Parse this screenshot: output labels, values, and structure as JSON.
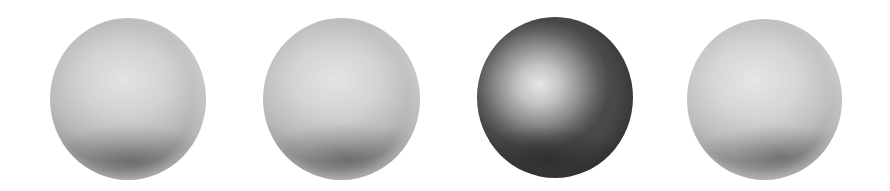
{
  "scene": {
    "description": "Four shaded grey spheres in a row on white background",
    "background": "#ffffff",
    "spheres": [
      {
        "label": "light-sphere-1",
        "tone": "light",
        "highlight": "#e3e3e3",
        "shadow": "#707070"
      },
      {
        "label": "light-sphere-2",
        "tone": "light",
        "highlight": "#e4e4e4",
        "shadow": "#707070"
      },
      {
        "label": "dark-sphere-3",
        "tone": "dark",
        "highlight": "#e6e6e6",
        "shadow": "#2a2a2a"
      },
      {
        "label": "light-sphere-4",
        "tone": "light",
        "highlight": "#e6e6e6",
        "shadow": "#707070"
      }
    ]
  }
}
